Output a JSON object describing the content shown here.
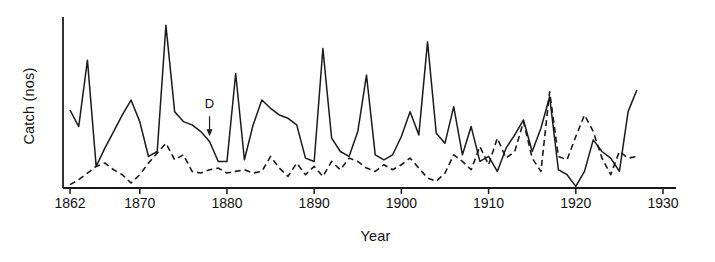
{
  "chart_data": {
    "type": "line",
    "title": "",
    "xlabel": "Year",
    "ylabel": "Catch (nos)",
    "xlim": [
      1862,
      1930
    ],
    "ylim": [
      0,
      100
    ],
    "grid": false,
    "legend": "none",
    "xticks": [
      "1862",
      "1870",
      "1880",
      "1890",
      "1900",
      "1910",
      "1920",
      "1930"
    ],
    "xtick_values": [
      1862,
      1870,
      1880,
      1890,
      1900,
      1910,
      1920,
      1930
    ],
    "yticks": [],
    "annotations": [
      {
        "label": "D",
        "x": 1878,
        "y": 42,
        "arrow": "down"
      }
    ],
    "series": [
      {
        "name": "solid-series",
        "style": "solid",
        "color": "#1a1a1a",
        "x": [
          1862,
          1863,
          1864,
          1865,
          1866,
          1867,
          1868,
          1869,
          1870,
          1871,
          1872,
          1873,
          1874,
          1875,
          1876,
          1877,
          1878,
          1879,
          1880,
          1881,
          1882,
          1883,
          1884,
          1885,
          1886,
          1887,
          1888,
          1889,
          1890,
          1891,
          1892,
          1893,
          1894,
          1895,
          1896,
          1897,
          1898,
          1899,
          1900,
          1901,
          1902,
          1903,
          1904,
          1905,
          1906,
          1907,
          1908,
          1909,
          1910,
          1911,
          1912,
          1913,
          1914,
          1915,
          1916,
          1917,
          1918,
          1919,
          1920,
          1921,
          1922,
          1923,
          1924,
          1925,
          1926,
          1927
        ],
        "values": [
          47,
          37,
          77,
          13,
          24,
          34,
          44,
          53,
          40,
          19,
          22,
          98,
          46,
          40,
          38,
          34,
          28,
          16,
          16,
          69,
          17,
          38,
          53,
          48,
          44,
          42,
          38,
          18,
          16,
          84,
          30,
          22,
          19,
          34,
          68,
          20,
          17,
          20,
          31,
          46,
          32,
          88,
          33,
          27,
          49,
          20,
          37,
          16,
          19,
          10,
          24,
          32,
          41,
          22,
          36,
          55,
          11,
          8,
          1,
          10,
          29,
          22,
          18,
          10,
          46,
          59
        ]
      },
      {
        "name": "dashed-series",
        "style": "dashed",
        "color": "#1a1a1a",
        "x": [
          1862,
          1863,
          1864,
          1865,
          1866,
          1867,
          1868,
          1869,
          1870,
          1871,
          1872,
          1873,
          1874,
          1875,
          1876,
          1877,
          1878,
          1879,
          1880,
          1881,
          1882,
          1883,
          1884,
          1885,
          1886,
          1887,
          1888,
          1889,
          1890,
          1891,
          1892,
          1893,
          1894,
          1895,
          1896,
          1897,
          1898,
          1899,
          1900,
          1901,
          1902,
          1903,
          1904,
          1905,
          1906,
          1907,
          1908,
          1909,
          1910,
          1911,
          1912,
          1913,
          1914,
          1915,
          1916,
          1917,
          1918,
          1919,
          1920,
          1921,
          1922,
          1923,
          1924,
          1925,
          1926,
          1927
        ],
        "values": [
          2,
          5,
          9,
          13,
          15,
          11,
          8,
          3,
          8,
          15,
          21,
          27,
          17,
          20,
          10,
          9,
          11,
          12,
          9,
          10,
          11,
          9,
          10,
          19,
          12,
          7,
          15,
          8,
          13,
          7,
          16,
          11,
          18,
          16,
          12,
          10,
          14,
          11,
          14,
          18,
          12,
          6,
          4,
          9,
          20,
          16,
          11,
          25,
          14,
          30,
          18,
          22,
          40,
          18,
          10,
          58,
          19,
          17,
          31,
          44,
          34,
          18,
          8,
          22,
          18,
          19
        ]
      }
    ]
  },
  "axes": {
    "year_label": "Year",
    "catch_label": "Catch (nos)"
  },
  "ticks": [
    {
      "label": "1862",
      "x": 1862
    },
    {
      "label": "1870",
      "x": 1870
    },
    {
      "label": "1880",
      "x": 1880
    },
    {
      "label": "1890",
      "x": 1890
    },
    {
      "label": "1900",
      "x": 1900
    },
    {
      "label": "1910",
      "x": 1910
    },
    {
      "label": "1920",
      "x": 1920
    },
    {
      "label": "1930",
      "x": 1930
    }
  ],
  "annotation": {
    "letter": "D"
  }
}
